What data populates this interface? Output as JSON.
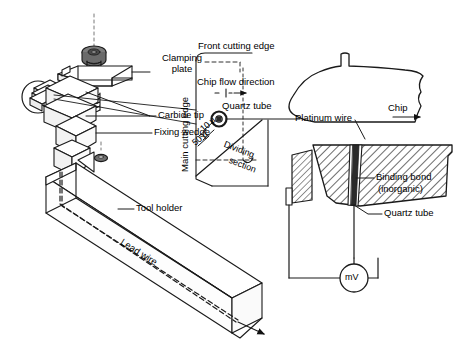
{
  "figure": {
    "kind": "technical-line-diagram"
  },
  "assembly_labels": {
    "clamping_plate": "Clamping\nplate",
    "clamping_plate_line1": "Clamping",
    "clamping_plate_line2": "plate",
    "carbide_tip": "Carbide tip",
    "fixing_wedge": "Fixing wedge",
    "tool_holder": "Tool holder",
    "lead_wire": "Lead wire"
  },
  "detail_labels": {
    "front_cutting_edge": "Front cutting edge",
    "main_cutting_edge": "Main cutting edge",
    "chip_flow_direction": "Chip flow direction",
    "quartz_tube": "Quartz tube",
    "dividing_line1": "Dividing",
    "dividing_line2": "section",
    "dim_10u": "10 µ",
    "dim_50u": "50 µ"
  },
  "section_labels": {
    "chip": "Chip",
    "platinum_wire": "Platinum wire",
    "binding_bond_line1": "Binding bond",
    "binding_bond_line2": "(inorganic)",
    "quartz_tube": "Quartz tube",
    "meter": "mV"
  },
  "colors": {
    "ink": "#1a1a1a",
    "hatch": "#3a3a3a",
    "wire_dark": "#2b2b2b",
    "paper": "#ffffff",
    "screw_gray": "#6f6f6f"
  }
}
